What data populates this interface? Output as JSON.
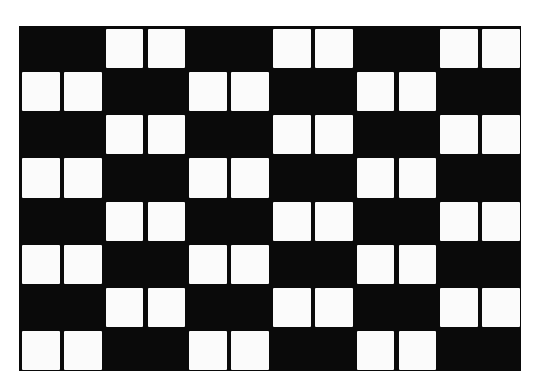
{
  "figure": {
    "rows": 8,
    "groups_per_row": 6,
    "cells_per_group": 2,
    "pattern_even_row": [
      "black",
      "white",
      "black",
      "white",
      "black",
      "white"
    ],
    "pattern_odd_row": [
      "white",
      "black",
      "white",
      "black",
      "white",
      "black"
    ],
    "colors": {
      "background": "#0a0a0a",
      "square": "#fbfbfb",
      "page": "#ffffff"
    }
  }
}
